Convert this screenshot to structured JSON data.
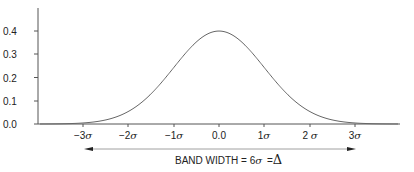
{
  "chart_data": {
    "type": "line",
    "title": "",
    "xlabel": "",
    "ylabel": "",
    "x_tick_labels": [
      "-3σ",
      "-2σ",
      "-1σ",
      "0.0",
      "1σ",
      "2σ",
      "3σ"
    ],
    "x_tick_values": [
      -3,
      -2,
      -1,
      0,
      1,
      2,
      3
    ],
    "y_tick_labels": [
      "0.0",
      "0.1",
      "0.2",
      "0.3",
      "0.4"
    ],
    "y_tick_values": [
      0.0,
      0.1,
      0.2,
      0.3,
      0.4
    ],
    "xlim": [
      -4,
      4
    ],
    "ylim": [
      0,
      0.5
    ],
    "grid": false,
    "series": [
      {
        "name": "Standard normal distribution",
        "x": [
          -4,
          -3.5,
          -3,
          -2.5,
          -2,
          -1.5,
          -1,
          -0.5,
          0,
          0.5,
          1,
          1.5,
          2,
          2.5,
          3,
          3.5,
          4
        ],
        "values": [
          0.0001,
          0.0009,
          0.0044,
          0.0175,
          0.054,
          0.1295,
          0.242,
          0.3521,
          0.3989,
          0.3521,
          0.242,
          0.1295,
          0.054,
          0.0175,
          0.0044,
          0.0009,
          0.0001
        ]
      }
    ],
    "annotations": [
      {
        "text": "BAND WIDTH = 6σ =Δ",
        "type": "double-arrow",
        "from_x": -3,
        "to_x": 3
      }
    ]
  },
  "labels": {
    "y0": "0.0",
    "y1": "0.1",
    "y2": "0.2",
    "y3": "0.3",
    "y4": "0.4",
    "xm3": "−3",
    "xm2": "−2",
    "xm1": "−1",
    "x0": "0.0",
    "x1": "1",
    "x2": "2 ",
    "x3": "3",
    "sigma": "σ",
    "band_text": "BAND WIDTH = 6",
    "band_eq": " =",
    "delta": "Δ"
  }
}
